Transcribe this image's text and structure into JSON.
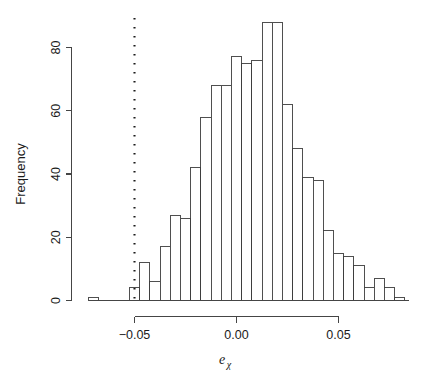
{
  "chart_data": {
    "type": "bar",
    "title": "",
    "subtitle": "",
    "xlabel": "e_chi",
    "xlabel_base": "e",
    "xlabel_subscript": "χ",
    "ylabel": "Frequency",
    "grid": false,
    "legend": "none",
    "xlim": [
      -0.0725,
      0.0845
    ],
    "ylim": [
      0,
      90
    ],
    "xticks": [
      -0.05,
      0.0,
      0.05
    ],
    "xtick_labels": [
      "−0.05",
      "0.00",
      "0.05"
    ],
    "yticks": [
      0,
      20,
      40,
      60,
      80
    ],
    "ytick_labels": [
      "0",
      "20",
      "40",
      "60",
      "80"
    ],
    "bin_width": 0.005,
    "bin_starts": [
      -0.0725,
      -0.0675,
      -0.0625,
      -0.0575,
      -0.0525,
      -0.0475,
      -0.0425,
      -0.0375,
      -0.0325,
      -0.0275,
      -0.0225,
      -0.0175,
      -0.0125,
      -0.0075,
      -0.0025,
      0.0025,
      0.0075,
      0.0125,
      0.0175,
      0.0225,
      0.0275,
      0.0325,
      0.0375,
      0.0425,
      0.0475,
      0.0525,
      0.0575,
      0.0625,
      0.0675,
      0.0725,
      0.0775
    ],
    "values": [
      1,
      0,
      0,
      0,
      4,
      12,
      6,
      17,
      27,
      26,
      42,
      58,
      68,
      68,
      77,
      75,
      76,
      88,
      88,
      62,
      48,
      39,
      38,
      22,
      15,
      14,
      11,
      4,
      7,
      4,
      1
    ],
    "annotations": [
      {
        "type": "vertical-line",
        "name": "threshold-line",
        "x": -0.05,
        "style": "dotted",
        "label": ""
      }
    ]
  },
  "axes": {
    "y_axis_name": "frequency-axis",
    "x_axis_name": "e-chi-axis"
  }
}
